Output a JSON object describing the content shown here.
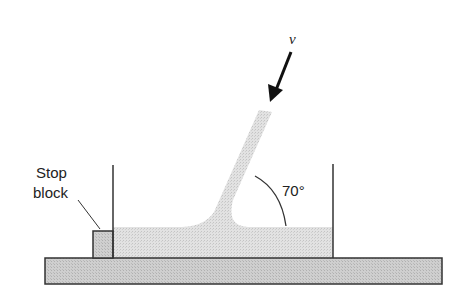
{
  "diagram": {
    "type": "fluid-jet-impinging-on-plate",
    "labels": {
      "velocity": "v",
      "angle": "70°",
      "stop_block_line1": "Stop",
      "stop_block_line2": "block"
    },
    "colors": {
      "fluid": "#d9d9d9",
      "plate": "#c8c8c8",
      "stroke": "#333333"
    }
  }
}
